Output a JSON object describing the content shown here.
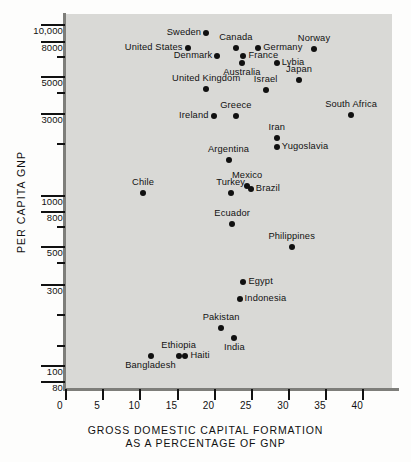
{
  "chart_data": {
    "type": "scatter",
    "title": "",
    "xlabel": "GROSS DOMESTIC CAPITAL FORMATION AS A PERCENTAGE OF GNP",
    "ylabel": "PER CAPITA GNP",
    "xlabel_line1": "GROSS DOMESTIC CAPITAL FORMATION",
    "xlabel_line2": "AS A PERCENTAGE OF GNP",
    "yscale": "log",
    "xscale": "linear",
    "xlim": [
      0,
      44
    ],
    "ylim": [
      72,
      11500
    ],
    "grid": false,
    "legend": "none",
    "xticks": [
      0,
      5,
      10,
      15,
      20,
      25,
      30,
      35,
      40
    ],
    "xtick_labels": [
      "0",
      "5",
      "10",
      "15",
      "20",
      "25",
      "30",
      "35",
      "40"
    ],
    "ytick_labels": [
      "10,000",
      "8000",
      "5000",
      "3000",
      "1000",
      "800",
      "500",
      "300",
      "100",
      "80"
    ],
    "ytick_values": [
      10000,
      8000,
      5000,
      3000,
      1000,
      800,
      500,
      300,
      100,
      80
    ],
    "yticks_minor": [
      6500,
      4000,
      2000,
      650,
      400,
      200,
      130
    ],
    "points": [
      {
        "label": "Sweden",
        "x": 19.0,
        "y": 8900,
        "pos": "left"
      },
      {
        "label": "United States",
        "x": 16.5,
        "y": 7300,
        "pos": "left"
      },
      {
        "label": "Canada",
        "x": 23.0,
        "y": 7300,
        "pos": "above"
      },
      {
        "label": "Germany",
        "x": 26.0,
        "y": 7300,
        "pos": "right"
      },
      {
        "label": "Denmark",
        "x": 20.5,
        "y": 6500,
        "pos": "left"
      },
      {
        "label": "France",
        "x": 24.0,
        "y": 6500,
        "pos": "right"
      },
      {
        "label": "Australia",
        "x": 23.8,
        "y": 5900,
        "pos": "below"
      },
      {
        "label": "Norway",
        "x": 33.5,
        "y": 7200,
        "pos": "above"
      },
      {
        "label": "Lybia",
        "x": 28.5,
        "y": 5900,
        "pos": "right"
      },
      {
        "label": "Japan",
        "x": 31.5,
        "y": 4700,
        "pos": "above"
      },
      {
        "label": "United Kingdom",
        "x": 19.0,
        "y": 4200,
        "pos": "above"
      },
      {
        "label": "Israel",
        "x": 27.0,
        "y": 4100,
        "pos": "above"
      },
      {
        "label": "South Africa",
        "x": 38.5,
        "y": 2950,
        "pos": "above"
      },
      {
        "label": "Greece",
        "x": 23.0,
        "y": 2900,
        "pos": "above"
      },
      {
        "label": "Ireland",
        "x": 20.0,
        "y": 2900,
        "pos": "left"
      },
      {
        "label": "Iran",
        "x": 28.5,
        "y": 2150,
        "pos": "above"
      },
      {
        "label": "Yugoslavia",
        "x": 28.5,
        "y": 1900,
        "pos": "right"
      },
      {
        "label": "Argentina",
        "x": 22.0,
        "y": 1600,
        "pos": "above"
      },
      {
        "label": "Mexico",
        "x": 24.5,
        "y": 1130,
        "pos": "above"
      },
      {
        "label": "Brazil",
        "x": 25.0,
        "y": 1080,
        "pos": "right"
      },
      {
        "label": "Turkey",
        "x": 22.3,
        "y": 1020,
        "pos": "above"
      },
      {
        "label": "Chile",
        "x": 10.5,
        "y": 1020,
        "pos": "above"
      },
      {
        "label": "Ecuador",
        "x": 22.5,
        "y": 670,
        "pos": "above"
      },
      {
        "label": "Philippines",
        "x": 30.5,
        "y": 490,
        "pos": "above"
      },
      {
        "label": "Egypt",
        "x": 24.0,
        "y": 305,
        "pos": "right"
      },
      {
        "label": "Indonesia",
        "x": 23.5,
        "y": 245,
        "pos": "right"
      },
      {
        "label": "Pakistan",
        "x": 21.0,
        "y": 165,
        "pos": "above"
      },
      {
        "label": "India",
        "x": 22.8,
        "y": 143,
        "pos": "below"
      },
      {
        "label": "Ethiopia",
        "x": 15.3,
        "y": 113,
        "pos": "above"
      },
      {
        "label": "Haiti",
        "x": 16.2,
        "y": 113,
        "pos": "right"
      },
      {
        "label": "Bangladesh",
        "x": 11.5,
        "y": 113,
        "pos": "below"
      }
    ]
  }
}
